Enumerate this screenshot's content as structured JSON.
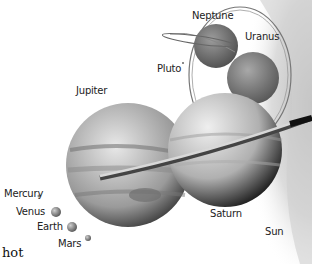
{
  "figure": {
    "caption_fragment": "hot",
    "planets": [
      {
        "name": "Neptune",
        "label": "Neptune"
      },
      {
        "name": "Uranus",
        "label": "Uranus"
      },
      {
        "name": "Pluto",
        "label": "Pluto"
      },
      {
        "name": "Jupiter",
        "label": "Jupiter"
      },
      {
        "name": "Saturn",
        "label": "Saturn"
      },
      {
        "name": "Sun",
        "label": "Sun"
      },
      {
        "name": "Mercury",
        "label": "Mercury"
      },
      {
        "name": "Venus",
        "label": "Venus"
      },
      {
        "name": "Earth",
        "label": "Earth"
      },
      {
        "name": "Mars",
        "label": "Mars"
      }
    ],
    "colors": {
      "background": "#ffffff",
      "planet_gray": "#8a8a8a",
      "label_text": "#222222"
    }
  }
}
